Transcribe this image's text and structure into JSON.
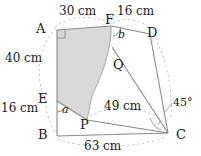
{
  "figure": {
    "colors": {
      "stroke": "#8a8a8a",
      "dashed": "#b0b0b0",
      "shade_fill": "#d9d9d9",
      "label_text": "#1a1a1a"
    },
    "points": [
      {
        "id": "A",
        "label": "A",
        "x": 57,
        "y": 30
      },
      {
        "id": "F",
        "label": "F",
        "x": 111,
        "y": 26
      },
      {
        "id": "D",
        "label": "D",
        "x": 150,
        "y": 34
      },
      {
        "id": "Q",
        "label": "Q",
        "x": 122,
        "y": 66
      },
      {
        "id": "E",
        "label": "E",
        "x": 57,
        "y": 101
      },
      {
        "id": "P",
        "label": "P",
        "x": 87,
        "y": 120
      },
      {
        "id": "B",
        "label": "B",
        "x": 57,
        "y": 136
      },
      {
        "id": "C",
        "label": "C",
        "x": 168,
        "y": 133
      }
    ],
    "point_labels": [
      {
        "name": "point-label-a",
        "text": "A",
        "x": 36,
        "y": 22
      },
      {
        "name": "point-label-f",
        "text": "F",
        "x": 105,
        "y": 14
      },
      {
        "name": "point-label-d",
        "text": "D",
        "x": 147,
        "y": 26
      },
      {
        "name": "point-label-q",
        "text": "Q",
        "x": 114,
        "y": 58
      },
      {
        "name": "point-label-e",
        "text": "E",
        "x": 38,
        "y": 92
      },
      {
        "name": "point-label-p",
        "text": "P",
        "x": 81,
        "y": 118
      },
      {
        "name": "point-label-b",
        "text": "B",
        "x": 38,
        "y": 128
      },
      {
        "name": "point-label-c",
        "text": "C",
        "x": 176,
        "y": 128
      }
    ],
    "measurements": [
      {
        "name": "length-af",
        "text": "30 cm",
        "x": 60,
        "y": 10
      },
      {
        "name": "length-fd",
        "text": "16 cm",
        "x": 117,
        "y": 10
      },
      {
        "name": "length-ae",
        "text": "40 cm",
        "x": 8,
        "y": 57
      },
      {
        "name": "length-eb",
        "text": "16 cm",
        "x": 2,
        "y": 105
      },
      {
        "name": "length-pc",
        "text": "49 cm",
        "x": 106,
        "y": 103
      },
      {
        "name": "length-bc",
        "text": "63 cm",
        "x": 84,
        "y": 142
      }
    ],
    "angles": [
      {
        "name": "angle-a-label",
        "text": "a",
        "x": 63,
        "y": 105,
        "kind": "variable"
      },
      {
        "name": "angle-b-label",
        "text": "b",
        "x": 119,
        "y": 31,
        "kind": "variable"
      },
      {
        "name": "angle-c-label",
        "text": "45°",
        "x": 174,
        "y": 103,
        "kind": "degree"
      }
    ],
    "marks": {
      "right_angle_at": "A",
      "angle_arc_at_e": "a",
      "angle_arc_at_f": "b",
      "angle_arc_at_c": "45°"
    },
    "segments": [
      {
        "name": "segment-a-f",
        "from": "A",
        "to": "F",
        "style": "solid"
      },
      {
        "name": "segment-a-e",
        "from": "A",
        "to": "E",
        "style": "solid"
      },
      {
        "name": "segment-e-b",
        "from": "E",
        "to": "B",
        "style": "solid"
      },
      {
        "name": "segment-b-c",
        "from": "B",
        "to": "C",
        "style": "solid"
      },
      {
        "name": "segment-p-c",
        "from": "P",
        "to": "C",
        "style": "solid"
      },
      {
        "name": "segment-f-d",
        "from": "F",
        "to": "D",
        "style": "solid"
      },
      {
        "name": "segment-d-c",
        "from": "D",
        "to": "C",
        "style": "solid"
      },
      {
        "name": "segment-q-c",
        "from": "Q",
        "to": "C",
        "style": "solid"
      },
      {
        "name": "segment-e-p",
        "from": "E",
        "to": "P",
        "style": "solid"
      }
    ],
    "dashed_arcs": [
      {
        "name": "dashed-arc-a-e-b",
        "desc": "left arc spanning A to B past E"
      },
      {
        "name": "dashed-arc-a-f",
        "desc": "top arc A to F labelled 30 cm"
      },
      {
        "name": "dashed-arc-f-d",
        "desc": "top arc F to D labelled 16 cm"
      },
      {
        "name": "dashed-arc-p-c",
        "desc": "arc P to C labelled 49 cm"
      },
      {
        "name": "dashed-arc-b-c",
        "desc": "bottom arc B to C labelled 63 cm"
      },
      {
        "name": "dashed-arc-d-c",
        "desc": "right arc D to C near 45 degrees"
      }
    ],
    "shaded_region": {
      "name": "shaded-region",
      "desc": "Region A-F-Q-P-E bounded above by AF, right by concave curve F-Q-P, bottom by P-E, left by E-A"
    }
  }
}
